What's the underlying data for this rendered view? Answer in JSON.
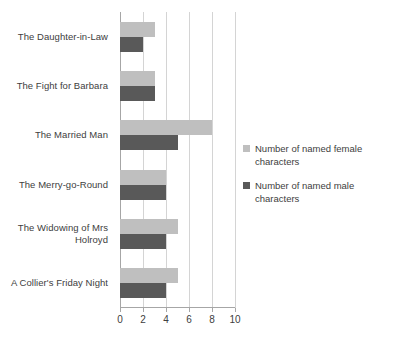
{
  "chart_data": {
    "type": "bar",
    "orientation": "horizontal",
    "title": "",
    "xlabel": "",
    "ylabel": "",
    "xlim": [
      0,
      10
    ],
    "xticks": [
      0,
      2,
      4,
      6,
      8,
      10
    ],
    "xtick_labels": [
      "0",
      "2",
      "4",
      "6",
      "8",
      "10"
    ],
    "grid": true,
    "legend_position": "right",
    "categories": [
      "The Daughter-in-Law",
      "The Fight for Barbara",
      "The Married Man",
      "The Merry-go-Round",
      "The Widowing of Mrs Holroyd",
      "A Collier's Friday Night"
    ],
    "series": [
      {
        "name": "Number of named female characters",
        "color": "#bfbfbf",
        "values": [
          3,
          3,
          8,
          4,
          5,
          5
        ]
      },
      {
        "name": "Number of named male characters",
        "color": "#595959",
        "values": [
          2,
          3,
          5,
          4,
          4,
          4
        ]
      }
    ]
  },
  "legend": {
    "items": [
      {
        "label": "Number of named female characters",
        "color": "#bfbfbf"
      },
      {
        "label": "Number of named male characters",
        "color": "#595959"
      }
    ]
  },
  "colors": {
    "female_series": "#bfbfbf",
    "male_series": "#595959",
    "gridline": "#d4d4d4",
    "axis": "#a6a6a6",
    "text": "#404040",
    "background": "#ffffff"
  }
}
